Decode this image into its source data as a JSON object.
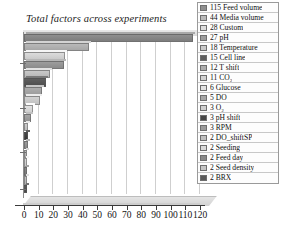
{
  "chart_data": {
    "type": "bar",
    "orientation": "horizontal",
    "title": "Total factors across experiments",
    "xlabel": "",
    "ylabel": "",
    "xlim": [
      0,
      120
    ],
    "xticks": [
      0,
      10,
      20,
      30,
      40,
      50,
      60,
      70,
      80,
      90,
      100,
      110,
      120
    ],
    "grid": true,
    "legend_position": "right",
    "categories": [
      "Feed volume",
      "Media volume",
      "Custom",
      "pH",
      "Temperature",
      "Cell line",
      "T shift",
      "CO2",
      "Glucose",
      "DO",
      "O2",
      "pH shift",
      "RPM",
      "DO_shiftSP",
      "Seeding",
      "Feed day",
      "Seed density",
      "BRX"
    ],
    "values": [
      115,
      44,
      28,
      27,
      18,
      15,
      12,
      11,
      6,
      5,
      3,
      3,
      3,
      2,
      2,
      2,
      2,
      2
    ],
    "colors": [
      "#8f8f8f",
      "#b9b9b9",
      "#dcdcdc",
      "#9d9d9d",
      "#c9c9c9",
      "#5f5f5f",
      "#adadad",
      "#d2d2d2",
      "#e2e2e2",
      "#a6a6a6",
      "#cfcfcf",
      "#474747",
      "#9b9b9b",
      "#bfbfbf",
      "#dadada",
      "#8a8a8a",
      "#c4c4c4",
      "#5a5a5a"
    ]
  },
  "legend": {
    "entries": [
      {
        "label": "115 Feed volume",
        "color": "#8f8f8f"
      },
      {
        "label": "44 Media volume",
        "color": "#b9b9b9"
      },
      {
        "label": "28 Custom",
        "color": "#dcdcdc"
      },
      {
        "label": "27 pH",
        "color": "#9d9d9d"
      },
      {
        "label": "18 Temperature",
        "color": "#c9c9c9"
      },
      {
        "label": "15 Cell line",
        "color": "#5f5f5f"
      },
      {
        "label": "12 T shift",
        "color": "#adadad"
      },
      {
        "label": "11 CO₂",
        "color": "#d2d2d2"
      },
      {
        "label": "6 Glucose",
        "color": "#e2e2e2"
      },
      {
        "label": "5 DO",
        "color": "#a6a6a6"
      },
      {
        "label": "3 O₂",
        "color": "#cfcfcf"
      },
      {
        "label": "3 pH shift",
        "color": "#474747"
      },
      {
        "label": "3 RPM",
        "color": "#9b9b9b"
      },
      {
        "label": "2 DO_shiftSP",
        "color": "#bfbfbf"
      },
      {
        "label": "2 Seeding",
        "color": "#dadada"
      },
      {
        "label": "2 Feed day",
        "color": "#8a8a8a"
      },
      {
        "label": "2 Seed density",
        "color": "#c4c4c4"
      },
      {
        "label": "2 BRX",
        "color": "#5a5a5a"
      }
    ]
  }
}
